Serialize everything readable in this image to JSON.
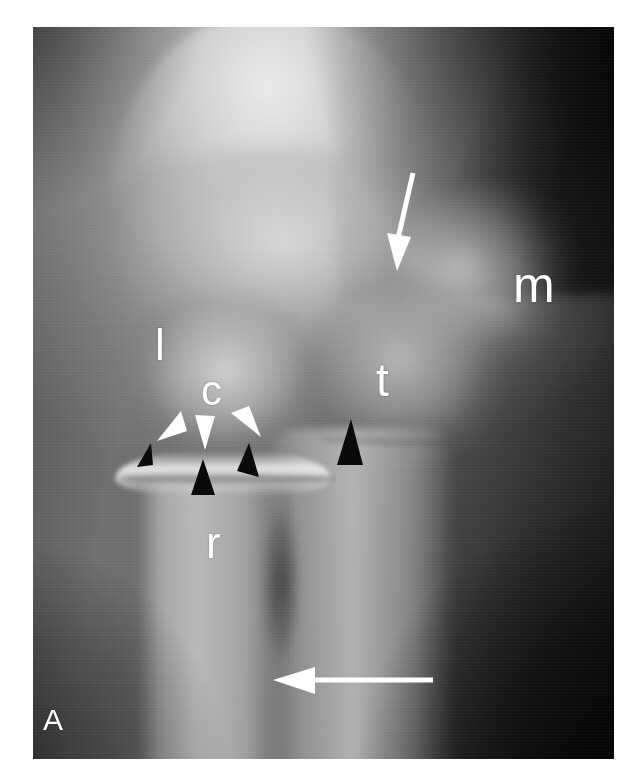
{
  "figure": {
    "panel_label": "A",
    "modality": "radiograph",
    "view": "anteroposterior elbow"
  },
  "labels": [
    {
      "id": "lateral-epicondyle",
      "text": "l",
      "x": 122,
      "y": 296,
      "size": 44,
      "color": "#ffffff"
    },
    {
      "id": "capitellum",
      "text": "c",
      "x": 168,
      "y": 343,
      "size": 42,
      "color": "#ffffff"
    },
    {
      "id": "trochlea",
      "text": "t",
      "x": 343,
      "y": 330,
      "size": 46,
      "color": "#ffffff"
    },
    {
      "id": "medial-epicondyle",
      "text": "m",
      "x": 480,
      "y": 233,
      "size": 50,
      "color": "#ffffff"
    },
    {
      "id": "radius",
      "text": "r",
      "x": 173,
      "y": 494,
      "size": 44,
      "color": "#ffffff"
    },
    {
      "id": "panel",
      "text": "A",
      "x": 10,
      "y": 678,
      "size": 30,
      "color": "#ffffff"
    }
  ],
  "markers": {
    "white_arrowheads": [
      {
        "id": "white-arrowhead-left",
        "x": 128,
        "y": 385,
        "rotation": -135,
        "color": "#ffffff"
      },
      {
        "id": "white-arrowhead-middle",
        "x": 173,
        "y": 398,
        "rotation": 180,
        "color": "#ffffff"
      },
      {
        "id": "white-arrowhead-right",
        "x": 212,
        "y": 383,
        "rotation": 145,
        "color": "#ffffff"
      }
    ],
    "black_arrowheads": [
      {
        "id": "black-arrowhead-left",
        "x": 110,
        "y": 438,
        "rotation": 20,
        "color": "#000000"
      },
      {
        "id": "black-arrowhead-middle",
        "x": 172,
        "y": 452,
        "rotation": 0,
        "color": "#000000"
      },
      {
        "id": "black-arrowhead-right",
        "x": 213,
        "y": 436,
        "rotation": -20,
        "color": "#000000"
      },
      {
        "id": "black-arrowhead-trochlea",
        "x": 318,
        "y": 400,
        "rotation": 0,
        "color": "#000000"
      }
    ],
    "arrows": [
      {
        "id": "arrow-down-supracondylar",
        "x": 378,
        "y": 148,
        "length": 86,
        "direction": "down",
        "tilt": -8,
        "color": "#ffffff"
      },
      {
        "id": "arrow-left-shaft",
        "x": 250,
        "y": 652,
        "length": 150,
        "direction": "left",
        "tilt": 0,
        "color": "#ffffff"
      }
    ]
  },
  "colors": {
    "page_background": "#ffffff",
    "film_light": "#d8d8d8",
    "film_mid": "#6e6e6e",
    "film_dark": "#101010",
    "annotation_white": "#ffffff",
    "annotation_black": "#000000"
  }
}
